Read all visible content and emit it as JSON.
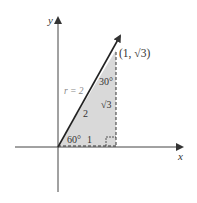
{
  "diagram": {
    "type": "unit-circle-reference-triangle",
    "axes": {
      "x_label": "x",
      "y_label": "y"
    },
    "point_label": "(1, √3)",
    "radius_label": "r = 2",
    "hypotenuse_label": "2",
    "opposite_label": "√3",
    "adjacent_label": "1",
    "angle_at_origin": "60°",
    "angle_at_top": "30°",
    "colors": {
      "triangle_fill": "#d9d9d9",
      "lines": "#333333",
      "axes": "#444444",
      "radius_label_color": "#888888"
    }
  }
}
